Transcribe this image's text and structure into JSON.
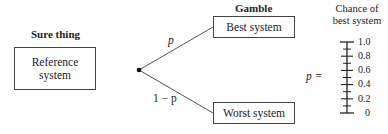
{
  "sure_thing": {
    "heading": "Sure thing",
    "box_label_line1": "Reference",
    "box_label_line2": "system"
  },
  "gamble": {
    "heading": "Gamble",
    "best_box": "Best system",
    "worst_box": "Worst system",
    "upper_branch_label": "p",
    "lower_branch_label": "1 − p"
  },
  "scale": {
    "title_line1": "Chance of",
    "title_line2": "best system",
    "p_label": "p =",
    "ticks": [
      "1.0",
      "0.8",
      "0.6",
      "0.4",
      "0.2",
      "0"
    ]
  },
  "colors": {
    "line": "#444444",
    "text": "#222222"
  }
}
